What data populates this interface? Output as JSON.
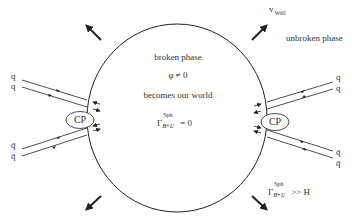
{
  "diagram": {
    "type": "electroweak-baryogenesis-bubble",
    "bubble": {
      "inside": {
        "phase_label": "broken phase",
        "vev_label": "φ ≠ 0",
        "world_label": "becomes our world",
        "rate_symbol": "Γ",
        "rate_superscript": "Sph",
        "rate_subscript": "B̸+L̸",
        "rate_relation": "= 0"
      },
      "outside": {
        "phase_label": "unbroken phase",
        "rate_symbol": "Γ",
        "rate_superscript": "Sph",
        "rate_subscript": "B̸+L̸",
        "rate_relation": ">> H"
      },
      "wall_velocity_label": "v",
      "wall_velocity_subscript": "Wall"
    },
    "left_vertex": {
      "label": "CP",
      "incoming_top": [
        "q",
        "q"
      ],
      "incoming_bottom": [
        "q̄",
        "q̄"
      ]
    },
    "right_vertex": {
      "label": "CP",
      "outgoing_top": [
        "q",
        "q"
      ],
      "outgoing_bottom": [
        "q̄",
        "q̄"
      ]
    },
    "expansion_arrows": [
      "up-left",
      "up-right",
      "down-left",
      "down-right"
    ],
    "colors": {
      "line": "#222222",
      "background": "#ffffff",
      "text": "#333333"
    }
  }
}
